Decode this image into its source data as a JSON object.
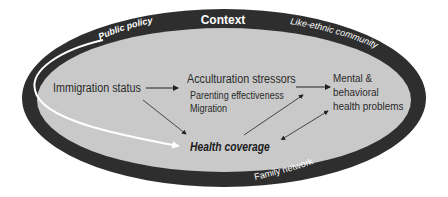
{
  "diagram": {
    "context_label": "Context",
    "ring_labels": {
      "top_left": "Public policy",
      "top_right": "Like-ethnic community",
      "bottom_right": "Family network"
    },
    "nodes": {
      "immigration_status": "Immigration status",
      "acculturation_stressors": "Acculturation stressors",
      "parenting_effectiveness": "Parenting effectiveness",
      "migration": "Migration",
      "mental_line1": "Mental &",
      "mental_line2": "behavioral",
      "mental_line3": "health problems",
      "health_coverage": "Health coverage"
    },
    "edges": [
      {
        "from": "Immigration status",
        "to": "Acculturation stressors"
      },
      {
        "from": "Immigration status",
        "to": "Health coverage"
      },
      {
        "from": "Acculturation stressors",
        "to": "Mental & behavioral health problems"
      },
      {
        "from": "Health coverage",
        "to": "Acculturation stressors"
      },
      {
        "from": "Health coverage",
        "to": "Mental & behavioral health problems",
        "bidirectional": true
      },
      {
        "from": "Public policy",
        "to": "Health coverage",
        "style": "white-curve"
      }
    ],
    "colors": {
      "ring": "#2e2e2e",
      "inner": "#c9c9c9",
      "text": "#2a2a2a",
      "ring_text": "#ffffff",
      "policy_curve": "#ffffff"
    }
  }
}
